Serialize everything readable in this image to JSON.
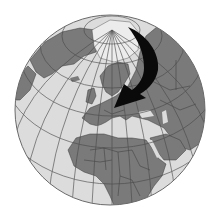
{
  "figure": {
    "type": "orthographic-globe",
    "region_centered": "Europe",
    "visible_regions": [
      "Arctic",
      "Greenland",
      "Europe",
      "Scandinavia",
      "Russia",
      "Middle East",
      "Africa",
      "Atlantic Ocean"
    ],
    "annotation": {
      "type": "curved-arrow",
      "description": "Black curved arrow from the Arctic / northern Russia sweeping south-west toward Central-Eastern Europe"
    }
  },
  "colors": {
    "background": "#ffffff",
    "ocean": "#dcdcdc",
    "land": "#7a7a7a",
    "ice": "#ececec",
    "graticule": "#4a4a4a",
    "borders": "#3a3a3a",
    "arrow": "#0a0a0a"
  }
}
